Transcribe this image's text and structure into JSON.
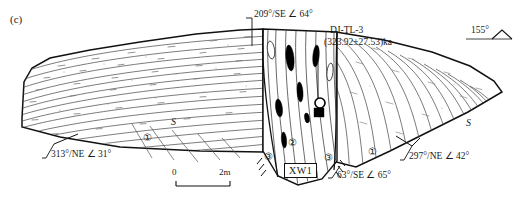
{
  "figure": {
    "panel_label": "(c)",
    "type": "geological-cross-section"
  },
  "annotations": {
    "fault_top_attitude": "209°/SE ∠ 64°",
    "sample_id": "DJ-TL-3",
    "sample_age": "(323.92±27.53)ka",
    "section_bearing": "155°",
    "left_limb_attitude": "313°/NE ∠ 31°",
    "right_limb_attitude": "297°/NE ∠ 42°",
    "fault_base_attitude": "63°/SE ∠ 65°",
    "trench_label": "XW1",
    "shear_left": "S",
    "shear_right": "S"
  },
  "units": {
    "u1": "①",
    "u2": "②",
    "u3_left": "③",
    "u3_right": "③",
    "u1_right": "①"
  },
  "scalebar": {
    "min": "0",
    "max": "2m"
  },
  "colors": {
    "ink": "#111111",
    "line": "#333333",
    "fill": "#ffffff",
    "lens": "#000000"
  }
}
